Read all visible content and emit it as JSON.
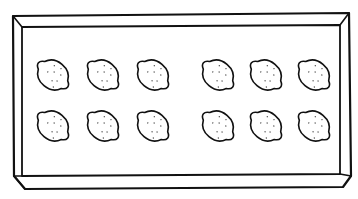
{
  "illustration": {
    "subject": "tray of lemons",
    "tray": {
      "style": "line-drawing",
      "stroke_color": "#111111",
      "fill_color": "#ffffff"
    },
    "lemons": {
      "count": 12,
      "rows": 2,
      "columns": 6,
      "groups": [
        {
          "name": "left-group",
          "columns": 3
        },
        {
          "name": "right-group",
          "columns": 3
        }
      ],
      "icon": "lemon-icon"
    }
  }
}
